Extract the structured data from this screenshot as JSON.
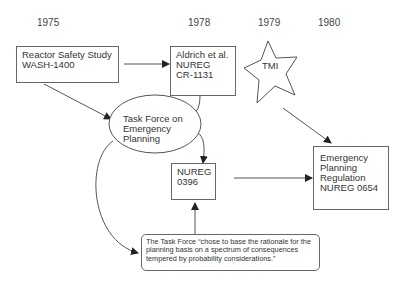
{
  "timeline": {
    "years": [
      "1975",
      "1978",
      "1979",
      "1980"
    ]
  },
  "nodes": {
    "reactor_safety_study": {
      "lines": [
        "Reactor Safety Study",
        "WASH-1400"
      ]
    },
    "aldrich": {
      "lines": [
        "Aldrich et al.",
        "NUREG",
        "CR-1131"
      ]
    },
    "tmi": {
      "label": "TMI"
    },
    "task_force": {
      "lines": [
        "Task Force on",
        "Emergency",
        "Planning"
      ]
    },
    "nureg_0396": {
      "lines": [
        "NUREG",
        "0396"
      ]
    },
    "ep_regulation": {
      "lines": [
        "Emergency",
        "Planning",
        "Regulation",
        "NUREG 0654"
      ]
    },
    "quote": {
      "lines": [
        "The Task Force “chose to base the rationale for the",
        "planning basis on a spectrum of consequences",
        "tempered by probability considerations.”"
      ]
    }
  },
  "colors": {
    "line": "#555555",
    "text": "#333333"
  }
}
